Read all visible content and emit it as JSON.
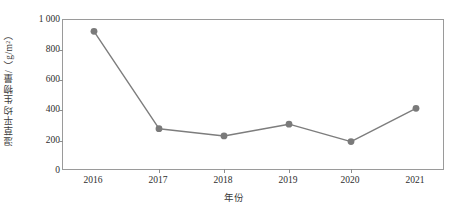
{
  "chart_data": {
    "type": "line",
    "title": "",
    "xlabel": "年份",
    "ylabel": "湿草平均生物量/（g/m²）",
    "categories": [
      "2016",
      "2017",
      "2018",
      "2019",
      "2020",
      "2021"
    ],
    "values": [
      925,
      280,
      232,
      310,
      195,
      415
    ],
    "series": [
      {
        "name": "湿草平均生物量",
        "values": [
          925,
          280,
          232,
          310,
          195,
          415
        ]
      }
    ],
    "yticks": [
      "0",
      "200",
      "400",
      "600",
      "800",
      "1 000"
    ],
    "ytick_values": [
      0,
      200,
      400,
      600,
      800,
      1000
    ],
    "ylim": [
      0,
      1000
    ],
    "grid": false,
    "legend": false,
    "legend_position": "none",
    "marker": "circle",
    "line_color": "#7d7d7d",
    "marker_color": "#7a7a7a",
    "axis_color": "#9a9a9a",
    "background_color": "#ffffff"
  }
}
